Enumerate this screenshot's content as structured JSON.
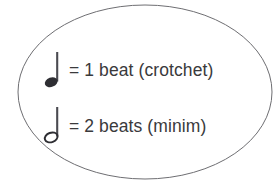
{
  "figure": {
    "kind": "music-note-value-legend",
    "shape": "ellipse",
    "background_color": "#ffffff",
    "ellipse": {
      "stroke_color": "#6e6e72",
      "stroke_width": 1,
      "fill": "none",
      "center_x": 145,
      "center_y": 92,
      "radius_x": 127,
      "radius_y": 87
    },
    "text_color": "#3a3a3c",
    "note_color": "#2e2e33"
  },
  "rows": [
    {
      "id": "crotchet",
      "note_name": "crotchet-note-icon",
      "note_type": "quarter-note",
      "notehead": "filled",
      "stem_direction": "up",
      "label": "= 1 beat (crotchet)",
      "beats": 1,
      "beat_word": "beat",
      "english_name": "crotchet",
      "american_name": "quarter note"
    },
    {
      "id": "minim",
      "note_name": "minim-note-icon",
      "note_type": "half-note",
      "notehead": "hollow",
      "stem_direction": "up",
      "label": "= 2 beats (minim)",
      "beats": 2,
      "beat_word": "beats",
      "english_name": "minim",
      "american_name": "half note"
    }
  ]
}
